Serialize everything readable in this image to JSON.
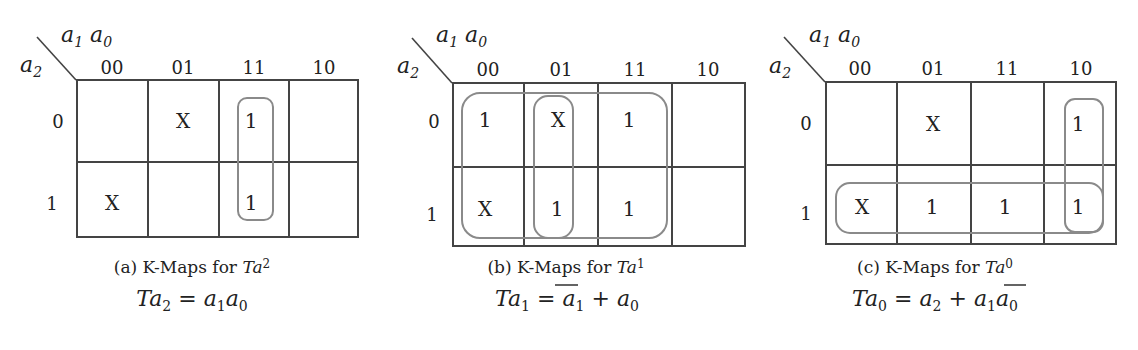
{
  "axis_labels": {
    "columns_var": "a1 a0",
    "rows_var": "a2"
  },
  "column_headers": [
    "00",
    "01",
    "11",
    "10"
  ],
  "row_headers": [
    "0",
    "1"
  ],
  "panels": [
    {
      "id": "a",
      "caption_prefix": "(a) K-Maps for ",
      "caption_var": "Ta",
      "caption_sub": "2",
      "cells": [
        [
          "",
          "X",
          "1",
          ""
        ],
        [
          "X",
          "",
          "1",
          ""
        ]
      ],
      "equation": {
        "lhs": "Ta",
        "lhs_sub": "2",
        "rhs": "= a₁a₀"
      }
    },
    {
      "id": "b",
      "caption_prefix": "(b) K-Maps for ",
      "caption_var": "Ta",
      "caption_sub": "1",
      "cells": [
        [
          "1",
          "X",
          "1",
          ""
        ],
        [
          "X",
          "1",
          "1",
          ""
        ]
      ],
      "equation": {
        "lhs": "Ta",
        "lhs_sub": "1",
        "rhs": "= ̅a₁ + a₀"
      }
    },
    {
      "id": "c",
      "caption_prefix": "(c) K-Maps for ",
      "caption_var": "Ta",
      "caption_sub": "0",
      "cells": [
        [
          "",
          "X",
          "",
          "1"
        ],
        [
          "X",
          "1",
          "1",
          "1"
        ]
      ],
      "equation": {
        "lhs": "Ta",
        "lhs_sub": "0",
        "rhs": "= a₂ + a₁̅a₀"
      }
    }
  ]
}
